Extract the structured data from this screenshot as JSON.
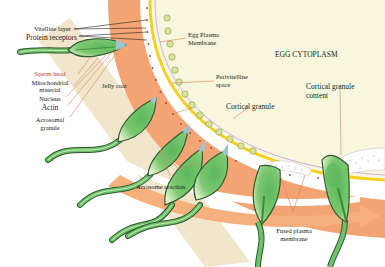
{
  "diagram": {
    "regions": {
      "egg_cytoplasm": "EGG CYTOPLASM"
    },
    "labels": {
      "vitelline_layer": "Vitelline layer",
      "protein_receptors": "Protein receptors",
      "egg_plasma_membrane_1": "Egg Plasma",
      "egg_plasma_membrane_2": "Membrane",
      "perivitelline_1": "Perivitelline",
      "perivitelline_2": "space",
      "cortical_granule": "Cortical granule",
      "cortical_granule_content_1": "Cortical granule",
      "cortical_granule_content_2": "content",
      "sperm_head": "Sperm head",
      "mitochondrial_1": "Mitochondrial",
      "mitochondrial_2": "material",
      "nucleus": "Nucleus",
      "actin": "Actin",
      "acrosomal_1": "Acrosomal",
      "acrosomal_2": "granule",
      "jelly_coat": "Jelly coat",
      "acrosome_reaction": "Acrosome reaction",
      "fused_1": "Fused plasma",
      "fused_2": "membrane"
    },
    "colors": {
      "cytoplasm": "#f7f6dc",
      "jelly_band": "#f2a775",
      "vitelline_yellow": "#f5d020",
      "membrane_line": "#c9a8d8",
      "sperm_green": "#5cb85c",
      "sperm_outline": "#2e5a2e",
      "sperm_light": "#dff0c8",
      "acrosome_blue": "#9ec3d6",
      "beige_band": "#ecdcb8",
      "granule_fill": "#d8e49a",
      "leader_red": "#d9805f",
      "sperm_head_text": "#c0392b"
    }
  }
}
